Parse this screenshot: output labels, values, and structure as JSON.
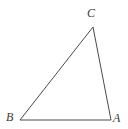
{
  "figure": {
    "type": "triangle-diagram",
    "background_color": "#ffffff",
    "stroke_color": "#4a4a4a",
    "stroke_width": 1,
    "label_color": "#3a3a3a",
    "canvas": {
      "width": 128,
      "height": 129
    },
    "vertices": [
      {
        "name": "A",
        "label": "A",
        "x": 111,
        "y": 120,
        "label_x": 116,
        "label_y": 118
      },
      {
        "name": "B",
        "label": "B",
        "x": 20,
        "y": 120,
        "label_x": 10,
        "label_y": 117
      },
      {
        "name": "C",
        "label": "C",
        "x": 93,
        "y": 27,
        "label_x": 91,
        "label_y": 13
      }
    ],
    "edges": [
      {
        "name": "side-BC",
        "from": "B",
        "to": "C"
      },
      {
        "name": "side-CA",
        "from": "C",
        "to": "A"
      },
      {
        "name": "side-AB",
        "from": "A",
        "to": "B"
      }
    ],
    "polygon_points": "20,120 93,27 111,120"
  }
}
